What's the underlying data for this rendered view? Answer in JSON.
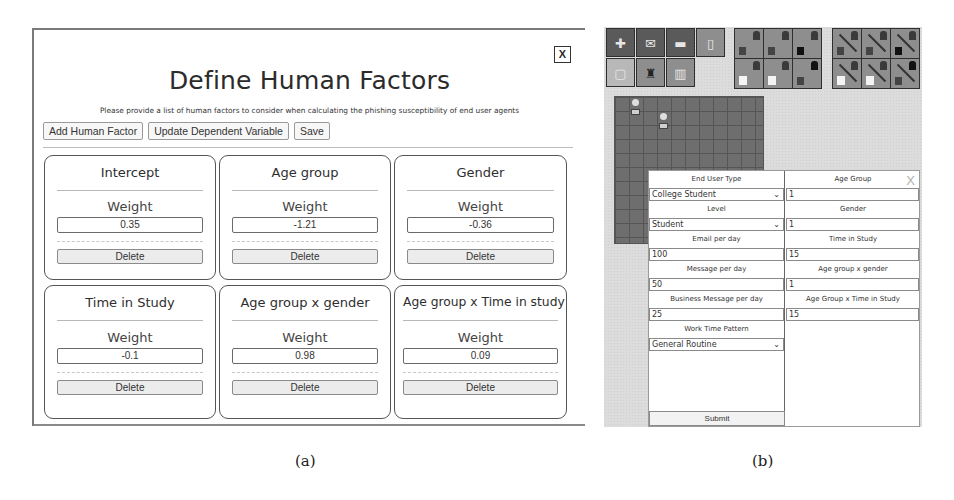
{
  "panel_a": {
    "close_label": "X",
    "title": "Define Human Factors",
    "subtitle": "Please provide a list of human factors to consider when calculating the phishing susceptibility of end user agents",
    "toolbar": {
      "add_label": "Add Human Factor",
      "update_label": "Update Dependent Variable",
      "save_label": "Save"
    },
    "factors": [
      {
        "name": "Intercept",
        "weight_label": "Weight",
        "weight": "0.35",
        "delete_label": "Delete"
      },
      {
        "name": "Age group",
        "weight_label": "Weight",
        "weight": "-1.21",
        "delete_label": "Delete"
      },
      {
        "name": "Gender",
        "weight_label": "Weight",
        "weight": "-0.36",
        "delete_label": "Delete"
      },
      {
        "name": "Time in Study",
        "weight_label": "Weight",
        "weight": "-0.1",
        "delete_label": "Delete"
      },
      {
        "name": "Age group x gender",
        "weight_label": "Weight",
        "weight": "0.98",
        "delete_label": "Delete"
      },
      {
        "name": "Age group x Time in study",
        "weight_label": "Weight",
        "weight": "0.09",
        "delete_label": "Delete"
      }
    ]
  },
  "panel_b": {
    "toolbar_icons": {
      "group1": [
        "add-agent-icon",
        "add-email-icon",
        "add-monitor-icon",
        "clipboard-icon",
        "add-document-icon",
        "agent-computer-icon",
        "bars-chart-icon"
      ],
      "group2": [
        "link-agents-icon",
        "link-agent-icon",
        "link-flag-icon",
        "link-document-icon",
        "link-image-icon",
        "link-message-icon"
      ],
      "group3": [
        "unlink-agents-icon",
        "unlink-agent-icon",
        "unlink-flag-icon",
        "unlink-document-icon",
        "unlink-image-icon",
        "unlink-message-icon"
      ]
    },
    "form": {
      "close_label": "X",
      "left": [
        {
          "label": "End User Type",
          "type": "select",
          "value": "College Student"
        },
        {
          "label": "Level",
          "type": "select",
          "value": "Student"
        },
        {
          "label": "Email per day",
          "type": "input",
          "value": "100"
        },
        {
          "label": "Message per day",
          "type": "input",
          "value": "50"
        },
        {
          "label": "Business Message per day",
          "type": "input",
          "value": "25"
        },
        {
          "label": "Work Time Pattern",
          "type": "select",
          "value": "General Routine"
        }
      ],
      "right": [
        {
          "label": "Age Group",
          "type": "input",
          "value": "1"
        },
        {
          "label": "Gender",
          "type": "input",
          "value": "1"
        },
        {
          "label": "Time in Study",
          "type": "input",
          "value": "15"
        },
        {
          "label": "Age group x gender",
          "type": "input",
          "value": "1"
        },
        {
          "label": "Age Group x Time in Study",
          "type": "input",
          "value": "15"
        }
      ],
      "submit_label": "Submit"
    }
  },
  "captions": {
    "a": "(a)",
    "b": "(b)"
  }
}
